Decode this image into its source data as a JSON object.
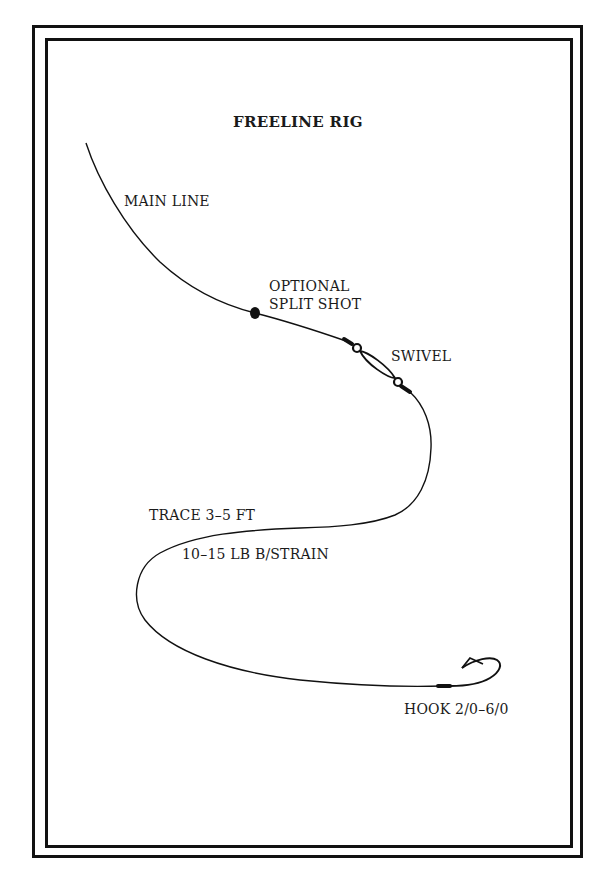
{
  "diagram": {
    "title": "FREELINE RIG",
    "labels": {
      "main_line": "MAIN LINE",
      "split_shot_line1": "OPTIONAL",
      "split_shot_line2": "SPLIT SHOT",
      "swivel": "SWIVEL",
      "trace": "TRACE 3–5 FT",
      "strain": "10–15 LB B/STRAIN",
      "hook": "HOOK 2/0–6/0"
    },
    "components": [
      {
        "name": "main-line",
        "icon": "line-icon"
      },
      {
        "name": "split-shot",
        "icon": "weight-dot-icon"
      },
      {
        "name": "swivel",
        "icon": "swivel-icon"
      },
      {
        "name": "trace",
        "icon": "line-icon"
      },
      {
        "name": "hook",
        "icon": "fish-hook-icon"
      }
    ],
    "colors": {
      "ink": "#111111",
      "background": "#ffffff"
    }
  }
}
